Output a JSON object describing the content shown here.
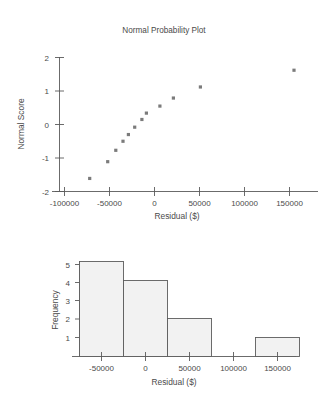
{
  "figure": {
    "background": "#ffffff",
    "marker_color": "#7b7b7b",
    "bar_fill": "#f2f2f2",
    "bar_stroke": "#5c5c5c",
    "axis_color": "#5a5a5a"
  },
  "chart_data": [
    {
      "type": "scatter",
      "title": "Normal Probability Plot",
      "xlabel": "Residual ($)",
      "ylabel": "Normal Score",
      "xlim": [
        -115000,
        180000
      ],
      "ylim": [
        -2.25,
        2.3
      ],
      "xticks": [
        -100000,
        -50000,
        0,
        50000,
        100000,
        150000
      ],
      "xticklabels": [
        "-100000",
        "-50000",
        "0",
        "50000",
        "100000",
        "150000"
      ],
      "yticks": [
        -2,
        -1,
        0,
        1,
        2
      ],
      "yticklabels": [
        "-2",
        "-1",
        "0",
        "1",
        "2"
      ],
      "grid": false,
      "legend": "none",
      "points": [
        {
          "x": -72000,
          "y": -1.61
        },
        {
          "x": -52000,
          "y": -1.11
        },
        {
          "x": -43000,
          "y": -0.77
        },
        {
          "x": -35000,
          "y": -0.5
        },
        {
          "x": -29000,
          "y": -0.3
        },
        {
          "x": -22000,
          "y": -0.08
        },
        {
          "x": -14000,
          "y": 0.15
        },
        {
          "x": -9000,
          "y": 0.34
        },
        {
          "x": 6000,
          "y": 0.55
        },
        {
          "x": 21000,
          "y": 0.79
        },
        {
          "x": 51000,
          "y": 1.12
        },
        {
          "x": 155000,
          "y": 1.62
        }
      ]
    },
    {
      "type": "bar",
      "title": "",
      "xlabel": "Residual ($)",
      "ylabel": "Frequency",
      "xlim": [
        -80000,
        180000
      ],
      "ylim": [
        0,
        5.4
      ],
      "xticks": [
        -50000,
        0,
        50000,
        100000,
        150000
      ],
      "xticklabels": [
        "-50000",
        "0",
        "50000",
        "100000",
        "150000"
      ],
      "yticks": [
        1,
        2,
        3,
        4,
        5
      ],
      "yticklabels": [
        "1",
        "2",
        "3",
        "4",
        "5"
      ],
      "grid": false,
      "legend": "none",
      "categories": [
        "-50000",
        "0",
        "50000",
        "100000",
        "150000"
      ],
      "values": [
        5,
        4,
        2,
        0,
        1
      ],
      "bin_edges": [
        -75000,
        -25000,
        25000,
        75000,
        125000,
        175000
      ]
    }
  ]
}
